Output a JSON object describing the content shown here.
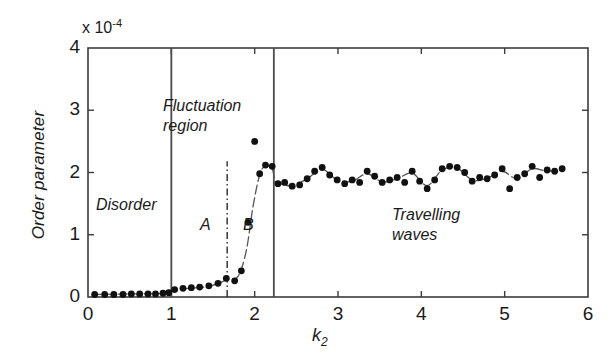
{
  "chart_data": {
    "type": "scatter",
    "title": "",
    "xlabel": "k_2",
    "ylabel": "Order parameter",
    "y_multiplier": "x 10",
    "y_multiplier_exponent": "-4",
    "xlim": [
      0,
      6
    ],
    "ylim": [
      0,
      4
    ],
    "xticks": [
      0,
      1,
      2,
      3,
      4,
      5,
      6
    ],
    "xtick_labels": [
      "0",
      "1",
      "2",
      "3",
      "4",
      "5",
      "6"
    ],
    "yticks": [
      0,
      1,
      2,
      3,
      4
    ],
    "ytick_labels": [
      "0",
      "1",
      "2",
      "3",
      "4"
    ],
    "grid": false,
    "legend": false,
    "marker": "filled-circle",
    "marker_color": "#111111",
    "line_color": "#555555",
    "frame_color": "#3b3b3b",
    "points": [
      [
        0.08,
        0.04
      ],
      [
        0.2,
        0.04
      ],
      [
        0.31,
        0.04
      ],
      [
        0.42,
        0.04
      ],
      [
        0.52,
        0.05
      ],
      [
        0.62,
        0.05
      ],
      [
        0.72,
        0.05
      ],
      [
        0.81,
        0.05
      ],
      [
        0.9,
        0.06
      ],
      [
        0.97,
        0.07
      ],
      [
        1.04,
        0.12
      ],
      [
        1.14,
        0.14
      ],
      [
        1.24,
        0.15
      ],
      [
        1.34,
        0.16
      ],
      [
        1.45,
        0.18
      ],
      [
        1.56,
        0.22
      ],
      [
        1.66,
        0.3
      ],
      [
        1.76,
        0.26
      ],
      [
        1.84,
        0.42
      ],
      [
        1.92,
        1.2
      ],
      [
        2.0,
        2.5
      ],
      [
        2.06,
        1.98
      ],
      [
        2.13,
        2.12
      ],
      [
        2.21,
        2.1
      ],
      [
        2.28,
        1.82
      ],
      [
        2.36,
        1.84
      ],
      [
        2.45,
        1.78
      ],
      [
        2.54,
        1.8
      ],
      [
        2.63,
        1.9
      ],
      [
        2.72,
        2.02
      ],
      [
        2.81,
        2.08
      ],
      [
        2.9,
        1.96
      ],
      [
        2.99,
        1.88
      ],
      [
        3.08,
        1.82
      ],
      [
        3.17,
        1.88
      ],
      [
        3.26,
        1.84
      ],
      [
        3.35,
        2.02
      ],
      [
        3.44,
        1.94
      ],
      [
        3.53,
        1.84
      ],
      [
        3.62,
        1.88
      ],
      [
        3.71,
        1.92
      ],
      [
        3.8,
        1.84
      ],
      [
        3.89,
        2.02
      ],
      [
        3.98,
        1.86
      ],
      [
        4.07,
        1.74
      ],
      [
        4.16,
        1.88
      ],
      [
        4.25,
        2.06
      ],
      [
        4.34,
        2.1
      ],
      [
        4.43,
        2.08
      ],
      [
        4.52,
        2.0
      ],
      [
        4.61,
        1.86
      ],
      [
        4.7,
        1.92
      ],
      [
        4.79,
        1.9
      ],
      [
        4.88,
        1.96
      ],
      [
        4.97,
        2.06
      ],
      [
        5.06,
        1.74
      ],
      [
        5.15,
        1.92
      ],
      [
        5.24,
        1.98
      ],
      [
        5.33,
        2.1
      ],
      [
        5.42,
        1.92
      ],
      [
        5.51,
        2.04
      ],
      [
        5.6,
        2.02
      ],
      [
        5.69,
        2.06
      ]
    ],
    "trend_line": [
      [
        0.05,
        0.04
      ],
      [
        0.5,
        0.05
      ],
      [
        0.95,
        0.06
      ],
      [
        1.02,
        0.11
      ],
      [
        1.2,
        0.14
      ],
      [
        1.45,
        0.17
      ],
      [
        1.66,
        0.27
      ],
      [
        1.8,
        0.33
      ],
      [
        1.9,
        0.75
      ],
      [
        1.98,
        1.45
      ],
      [
        2.06,
        1.96
      ],
      [
        2.13,
        2.11
      ],
      [
        2.21,
        2.06
      ],
      [
        2.25,
        1.83
      ],
      [
        2.3,
        1.82
      ],
      [
        2.45,
        1.79
      ],
      [
        2.63,
        1.9
      ],
      [
        2.81,
        2.05
      ],
      [
        2.99,
        1.88
      ],
      [
        3.17,
        1.86
      ],
      [
        3.35,
        1.98
      ],
      [
        3.53,
        1.85
      ],
      [
        3.71,
        1.9
      ],
      [
        3.89,
        1.99
      ],
      [
        4.07,
        1.79
      ],
      [
        4.25,
        2.04
      ],
      [
        4.43,
        2.07
      ],
      [
        4.61,
        1.88
      ],
      [
        4.79,
        1.91
      ],
      [
        4.97,
        2.02
      ],
      [
        5.15,
        1.9
      ],
      [
        5.33,
        2.06
      ],
      [
        5.51,
        2.02
      ],
      [
        5.69,
        2.05
      ]
    ],
    "dividers": [
      {
        "name": "disorder-boundary",
        "x": 1.0,
        "style": "solid",
        "y_from": 0.0,
        "y_to": 4.0
      },
      {
        "name": "region-ab-boundary",
        "x": 1.67,
        "style": "dash-dot",
        "y_from": 0.0,
        "y_to": 2.18
      },
      {
        "name": "travelling-waves-boundary",
        "x": 2.23,
        "style": "solid",
        "y_from": 0.0,
        "y_to": 4.0
      }
    ],
    "annotations": [
      {
        "name": "disorder",
        "text": "Disorder",
        "x": 0.25,
        "y": 1.45
      },
      {
        "name": "fluctuation-region",
        "text": "Fluctuation\nregion",
        "x": 1.12,
        "y": 3.05
      },
      {
        "name": "region-a",
        "text": "A",
        "x": 1.5,
        "y": 1.2
      },
      {
        "name": "region-b",
        "text": "B",
        "x": 2.0,
        "y": 1.2
      },
      {
        "name": "travelling-waves",
        "text": "Travelling\nwaves",
        "x": 3.95,
        "y": 1.45
      }
    ]
  },
  "labels": {
    "y_axis_title": "Order parameter",
    "x_axis_title_base": "k",
    "x_axis_title_sub": "2",
    "multiplier_base": "x 10",
    "multiplier_exp": "-4",
    "disorder": "Disorder",
    "fluctuation_line1": "Fluctuation",
    "fluctuation_line2": "region",
    "region_a": "A",
    "region_b": "B",
    "travelling_line1": "Travelling",
    "travelling_line2": "waves"
  }
}
